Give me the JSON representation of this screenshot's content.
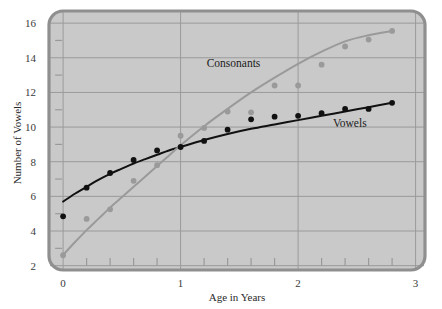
{
  "figure": {
    "background_color": "#ffffff",
    "plot_area_color": "#c9c9c9",
    "frame_color": "#8f8f8f",
    "gridline_color": "#9a9a9a"
  },
  "chart_data": {
    "type": "scatter",
    "title": "",
    "subtitle": "",
    "xlabel": "Age in Years",
    "ylabel": "Number of Vowels",
    "xlim": [
      -0.12,
      3.08
    ],
    "ylim": [
      1.75,
      16.7
    ],
    "x_major_ticks": [
      0,
      1,
      2,
      3
    ],
    "x_major_tick_labels": [
      "0",
      "1",
      "2",
      "3"
    ],
    "x_minor_tick_step": 0.2,
    "y_major_ticks": [
      2,
      4,
      6,
      8,
      10,
      12,
      14,
      16
    ],
    "y_major_tick_labels": [
      "2",
      "4",
      "6",
      "8",
      "10",
      "12",
      "14",
      "16"
    ],
    "y_minor_ticks": [
      3,
      5,
      7,
      9,
      11,
      13,
      15
    ],
    "grid": "major-horizontal-and-vertical",
    "legend_position": "inline-annotations",
    "series": [
      {
        "name": "Vowels",
        "color": "#111111",
        "marker": "filled-circle",
        "label_annotation": "Vowels",
        "label_x": 2.44,
        "label_y": 10.0,
        "x": [
          0.0,
          0.2,
          0.4,
          0.6,
          0.8,
          1.0,
          1.2,
          1.4,
          1.6,
          1.8,
          2.0,
          2.2,
          2.4,
          2.6,
          2.8
        ],
        "y": [
          4.85,
          6.5,
          7.35,
          8.1,
          8.65,
          8.85,
          9.2,
          9.85,
          10.45,
          10.6,
          10.65,
          10.8,
          11.05,
          11.05,
          11.4
        ],
        "fit_curve": {
          "type": "logarithmic",
          "points_x": [
            0.0,
            0.1,
            0.2,
            0.3,
            0.4,
            0.5,
            0.6,
            0.7,
            0.8,
            0.9,
            1.0,
            1.2,
            1.4,
            1.6,
            1.8,
            2.0,
            2.2,
            2.4,
            2.6,
            2.8
          ],
          "points_y": [
            5.7,
            6.15,
            6.55,
            6.95,
            7.3,
            7.6,
            7.9,
            8.15,
            8.4,
            8.65,
            8.85,
            9.25,
            9.6,
            9.9,
            10.15,
            10.4,
            10.65,
            10.9,
            11.15,
            11.4
          ]
        }
      },
      {
        "name": "Consonants",
        "color": "#9a9a9a",
        "marker": "filled-circle",
        "label_annotation": "Consonants",
        "label_x": 1.45,
        "label_y": 13.45,
        "x": [
          0.0,
          0.2,
          0.4,
          0.6,
          0.8,
          1.0,
          1.2,
          1.4,
          1.6,
          1.8,
          2.0,
          2.2,
          2.4,
          2.6,
          2.8
        ],
        "y": [
          2.6,
          4.7,
          5.25,
          6.9,
          7.8,
          9.5,
          9.95,
          10.9,
          10.85,
          12.4,
          12.4,
          13.6,
          14.65,
          15.05,
          15.55
        ],
        "fit_curve": {
          "type": "smooth-increasing",
          "points_x": [
            0.0,
            0.1,
            0.2,
            0.3,
            0.4,
            0.5,
            0.6,
            0.7,
            0.8,
            0.9,
            1.0,
            1.2,
            1.4,
            1.6,
            1.8,
            2.0,
            2.2,
            2.4,
            2.6,
            2.8
          ],
          "points_y": [
            2.62,
            3.35,
            4.05,
            4.7,
            5.35,
            5.95,
            6.55,
            7.15,
            7.75,
            8.35,
            8.95,
            10.05,
            11.05,
            12.0,
            12.85,
            13.65,
            14.35,
            14.95,
            15.3,
            15.55
          ]
        }
      }
    ]
  }
}
